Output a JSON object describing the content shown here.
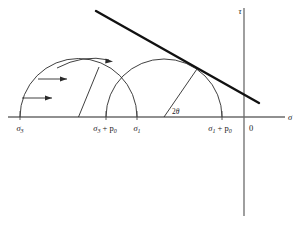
{
  "figure": {
    "type": "mohr-circle-stress-diagram"
  },
  "axes": {
    "vertical_label": "τ",
    "horizontal_label": "σ",
    "origin_label": "0",
    "origin_x_px": 244,
    "baseline_y_px": 117
  },
  "tick_labels": [
    {
      "id": "sigma3",
      "base": "σ",
      "sub": "3",
      "suffix": "",
      "x_px": 20
    },
    {
      "id": "sigma3-plus-p0",
      "base": "σ",
      "sub": "3",
      "suffix": " + p",
      "suffix_sub": "0",
      "x_px": 107
    },
    {
      "id": "sigma1",
      "base": "σ",
      "sub": "1",
      "suffix": "",
      "x_px": 137
    },
    {
      "id": "sigma1-plus-p0",
      "base": "σ",
      "sub": "1",
      "suffix": " + p",
      "suffix_sub": "0",
      "x_px": 222
    }
  ],
  "angle_annotation": {
    "label": "2θ",
    "base": "2",
    "symbol": "θ",
    "x_px": 175,
    "y_px": 112
  },
  "circles": [
    {
      "name": "initial-circle",
      "left_px": 20,
      "right_px": 137,
      "center_px": 78.5,
      "radius_px": 58.5
    },
    {
      "name": "shifted-circle",
      "left_px": 106,
      "right_px": 222,
      "center_px": 164,
      "radius_px": 58
    }
  ],
  "envelope": {
    "name": "failure-envelope",
    "x1_px": 96,
    "y1_px": 11,
    "x2_px": 259,
    "y2_px": 103
  },
  "pore_pressure_arrows": {
    "count": 3,
    "direction": "right",
    "meaning": "pore pressure shift p0"
  },
  "colors": {
    "axis": "#6b6b6b",
    "curve": "#2a2a2a",
    "envelope": "#111111",
    "text": "#1a1a1a",
    "background": "#ffffff"
  }
}
